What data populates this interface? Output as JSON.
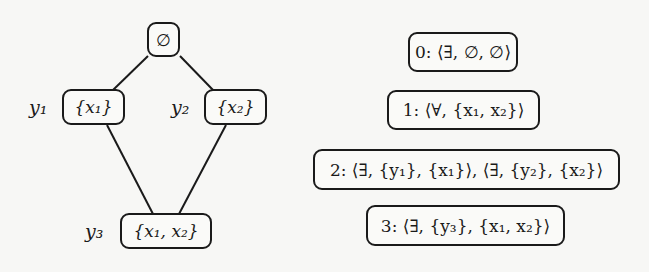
{
  "lattice": {
    "edges": [
      {
        "from": "empty",
        "to": "x1"
      },
      {
        "from": "empty",
        "to": "x2"
      },
      {
        "from": "x1",
        "to": "x1x2"
      },
      {
        "from": "x2",
        "to": "x1x2"
      }
    ],
    "nodes": {
      "empty": {
        "set": "∅",
        "label": ""
      },
      "x1": {
        "set": "{x₁}",
        "label": "y₁"
      },
      "x2": {
        "set": "{x₂}",
        "label": "y₂"
      },
      "x1x2": {
        "set": "{x₁, x₂}",
        "label": "y₃"
      }
    }
  },
  "levels": [
    {
      "index": "0",
      "text": "0: ⟨∃, ∅, ∅⟩"
    },
    {
      "index": "1",
      "text": "1: ⟨∀, {x₁, x₂}⟩"
    },
    {
      "index": "2",
      "text": "2: ⟨∃, {y₁}, {x₁}⟩, ⟨∃, {y₂}, {x₂}⟩"
    },
    {
      "index": "3",
      "text": "3: ⟨∃, {y₃}, {x₁, x₂}⟩"
    }
  ],
  "colors": {
    "stroke": "#1a1a1a",
    "background": "#f7f7f5"
  }
}
